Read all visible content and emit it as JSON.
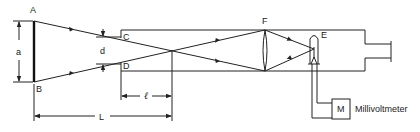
{
  "diagram": {
    "type": "optical-schematic",
    "labels": {
      "A": "A",
      "B": "B",
      "C": "C",
      "D": "D",
      "E": "E",
      "F": "F",
      "M": "M",
      "a": "a",
      "d": "d",
      "l": "ℓ",
      "L": "L",
      "meter": "Millivoltmeter"
    },
    "components": [
      {
        "id": "source-plate",
        "endpoints": [
          "A",
          "B"
        ],
        "dimension": "a"
      },
      {
        "id": "tube-aperture",
        "endpoints": [
          "C",
          "D"
        ],
        "dimension": "d"
      },
      {
        "id": "lens",
        "label": "F"
      },
      {
        "id": "detector",
        "label": "E"
      },
      {
        "id": "meter",
        "label": "M",
        "caption": "Millivoltmeter"
      },
      {
        "id": "eyepiece"
      }
    ],
    "dimensions": [
      {
        "label": "a",
        "from": "A",
        "to": "B"
      },
      {
        "label": "d",
        "from": "C",
        "to": "D"
      },
      {
        "label": "ℓ",
        "from": "tube-entrance",
        "to": "ray-crossing"
      },
      {
        "label": "L",
        "from": "source-plate",
        "to": "ray-crossing"
      }
    ]
  }
}
